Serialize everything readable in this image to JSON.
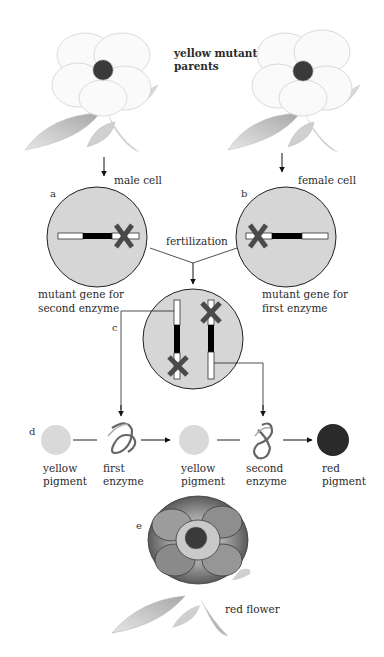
{
  "parents": {
    "label_line1": "yellow mutant",
    "label_line2": "parents",
    "left_flower": "yellow flower (male parent)",
    "right_flower": "yellow flower (female parent)"
  },
  "cells": {
    "a": {
      "letter": "a",
      "label": "male cell",
      "caption_line1": "mutant gene for",
      "caption_line2": "second enzyme"
    },
    "b": {
      "letter": "b",
      "label": "female cell",
      "caption_line1": "mutant gene for",
      "caption_line2": "first enzyme"
    },
    "c": {
      "letter": "c"
    },
    "fertilization_label": "fertilization"
  },
  "pathway": {
    "letter": "d",
    "steps": [
      {
        "line1": "yellow",
        "line2": "pigment",
        "color": "#d9d9d9"
      },
      {
        "line1": "first",
        "line2": "enzyme"
      },
      {
        "line1": "yellow",
        "line2": "pigment",
        "color": "#d9d9d9"
      },
      {
        "line1": "second",
        "line2": "enzyme"
      },
      {
        "line1": "red",
        "line2": "pigment",
        "color": "#2a2a2a"
      }
    ]
  },
  "result": {
    "letter": "e",
    "label": "red flower"
  },
  "colors": {
    "cell_fill": "#d6d6d6",
    "gene_mark": "#4a4a4a",
    "line": "#222222"
  }
}
